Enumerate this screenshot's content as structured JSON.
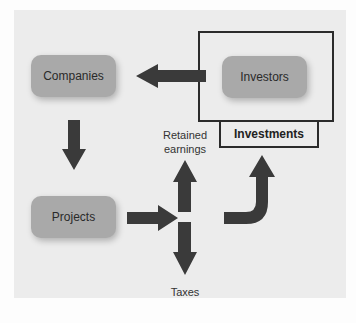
{
  "diagram": {
    "nodes": {
      "companies": "Companies",
      "investors": "Investors",
      "projects": "Projects"
    },
    "labels": {
      "investments": "Investments",
      "retained_earnings_line1": "Retained",
      "retained_earnings_line2": "earnings",
      "taxes": "Taxes"
    },
    "arrows": [
      {
        "from": "investors",
        "to": "companies"
      },
      {
        "from": "companies",
        "to": "projects"
      },
      {
        "from": "projects",
        "to": "split"
      },
      {
        "from": "split",
        "to": "retained_earnings"
      },
      {
        "from": "split",
        "to": "taxes"
      },
      {
        "from": "split",
        "to": "investors",
        "shape": "curved"
      }
    ],
    "colors": {
      "panel": "#ececec",
      "node_fill": "#a9a9a9",
      "arrow": "#3a3a3a",
      "frame": "#2b2b2b"
    }
  }
}
